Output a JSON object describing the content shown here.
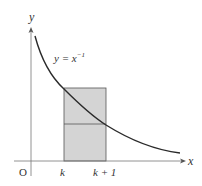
{
  "figure": {
    "function_label": "y = x",
    "function_exponent": "−1",
    "axis_x_label": "x",
    "axis_y_label": "y",
    "origin_label": "O",
    "tick_k_label": "k",
    "tick_k1_label": "k + 1",
    "colors": {
      "rect_fill": "#d4d4d4",
      "curve": "#2a2a2a",
      "axis": "#666666"
    }
  }
}
